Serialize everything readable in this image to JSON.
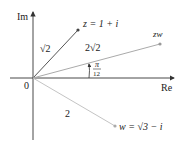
{
  "diagram": {
    "type": "complex-plane",
    "axes": {
      "x_label": "Re",
      "y_label": "Im",
      "origin_label": "0"
    },
    "points": [
      {
        "id": "z",
        "label": "z = 1 + i",
        "modulus_label": "√2",
        "color": "#555555"
      },
      {
        "id": "zw",
        "label": "zw",
        "modulus_label": "2√2",
        "color": "#aaaaaa"
      },
      {
        "id": "w",
        "label": "w = √3 − i",
        "modulus_label": "2",
        "color": "#bbbbbb"
      }
    ],
    "angle_label": {
      "num": "π",
      "den": "12"
    }
  }
}
